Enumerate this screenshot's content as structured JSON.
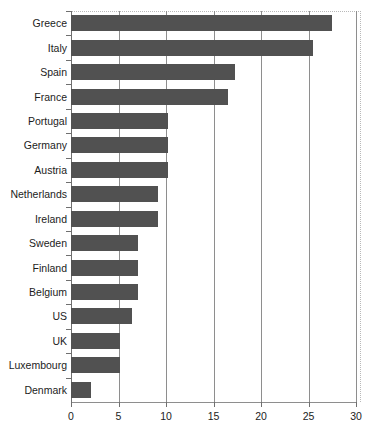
{
  "chart_data": {
    "type": "bar",
    "orientation": "horizontal",
    "title": "",
    "subtitle": "",
    "xlabel": "",
    "ylabel": "",
    "xlim": [
      0,
      30
    ],
    "ylim": null,
    "grid": "vertical gridlines at every x tick",
    "legend": null,
    "legend_position": "none",
    "xticks": [
      0,
      5,
      10,
      15,
      20,
      25,
      30
    ],
    "xticklabels": [
      "0",
      "5",
      "10",
      "15",
      "20",
      "25",
      "30"
    ],
    "categories": [
      "Greece",
      "Italy",
      "Spain",
      "France",
      "Portugal",
      "Germany",
      "Austria",
      "Netherlands",
      "Ireland",
      "Sweden",
      "Finland",
      "Belgium",
      "US",
      "UK",
      "Luxembourg",
      "Denmark"
    ],
    "values": [
      27.5,
      25.5,
      17.3,
      16.5,
      10.2,
      10.2,
      10.2,
      9.2,
      9.2,
      7.1,
      7.0,
      7.0,
      6.4,
      5.2,
      5.2,
      2.1
    ],
    "bar_color": "#515151",
    "axis_color": "#8e8e8e",
    "plot_border_color": "#b9b9b9",
    "background_color": "#ffffff"
  }
}
